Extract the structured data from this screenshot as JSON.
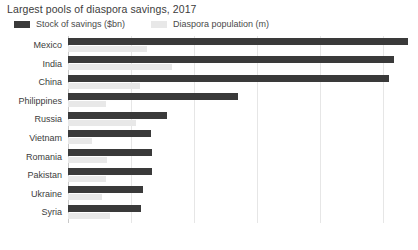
{
  "chart_data": {
    "type": "bar",
    "orientation": "horizontal",
    "title": "Largest pools of diaspora savings, 2017",
    "xlabel": "",
    "ylabel": "",
    "xlim": [
      0,
      54
    ],
    "grid": true,
    "legend_position": "top-left",
    "xticks": [
      0,
      10,
      20,
      30,
      40,
      50
    ],
    "xtick_labels": [
      "0",
      "10",
      "20",
      "30",
      "40",
      "50"
    ],
    "categories": [
      "Mexico",
      "India",
      "China",
      "Philippines",
      "Russia",
      "Vietnam",
      "Romania",
      "Pakistan",
      "Ukraine",
      "Syria"
    ],
    "series": [
      {
        "name": "Stock of savings ($bn)",
        "color": "#3a3a3a",
        "values": [
          54.0,
          51.7,
          51.0,
          27.0,
          15.7,
          13.2,
          13.3,
          13.3,
          11.9,
          11.6
        ]
      },
      {
        "name": "Diaspora population (m)",
        "color": "#e8e8e8",
        "values": [
          12.5,
          16.5,
          11.5,
          6.0,
          10.8,
          3.8,
          6.2,
          6.0,
          5.4,
          6.6
        ]
      }
    ]
  },
  "colors": {
    "dark_series": "#3a3a3a",
    "light_series": "#e8e8e8",
    "gridline": "#e6e6e6",
    "axis": "#c9c9c9",
    "text": "#3c3c3c",
    "background": "#ffffff"
  }
}
